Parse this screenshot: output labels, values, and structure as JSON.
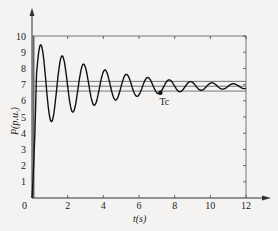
{
  "chart_data": {
    "type": "line",
    "title": "",
    "xlabel": "t(s)",
    "ylabel": "P(p.u.)",
    "xlim": [
      0,
      12
    ],
    "ylim": [
      0,
      10
    ],
    "xticks": [
      "0",
      "2",
      "4",
      "6",
      "8",
      "10",
      "12"
    ],
    "yticks": [
      "1",
      "2",
      "3",
      "4",
      "5",
      "6",
      "7",
      "8",
      "9",
      "10"
    ],
    "grid": false,
    "series": [
      {
        "name": "P(t) oscillation",
        "model": "damped-sine",
        "final_value": 6.9,
        "initial_value": 0,
        "first_peak": 9.4,
        "period_s": 1.2,
        "points": [
          [
            0,
            0
          ],
          [
            0.5,
            9.4
          ],
          [
            1.05,
            4.3
          ],
          [
            1.7,
            9.1
          ],
          [
            2.25,
            4.9
          ],
          [
            2.95,
            8.4
          ],
          [
            3.5,
            5.5
          ],
          [
            4.15,
            7.9
          ],
          [
            4.7,
            6.0
          ],
          [
            5.45,
            7.6
          ],
          [
            6.0,
            6.3
          ],
          [
            6.7,
            7.3
          ],
          [
            7.2,
            6.5
          ],
          [
            7.9,
            7.2
          ],
          [
            8.5,
            6.6
          ],
          [
            9.1,
            7.15
          ],
          [
            9.7,
            6.65
          ],
          [
            10.3,
            7.1
          ],
          [
            10.9,
            6.7
          ],
          [
            11.5,
            7.05
          ],
          [
            12,
            6.85
          ]
        ]
      }
    ],
    "reference_lines": [
      {
        "name": "upper band",
        "y": 7.2
      },
      {
        "name": "steady value",
        "y": 6.9
      },
      {
        "name": "lower band",
        "y": 6.6
      }
    ],
    "annotations": [
      {
        "text": "Tc",
        "x": 7.2,
        "y": 6.5
      }
    ]
  }
}
